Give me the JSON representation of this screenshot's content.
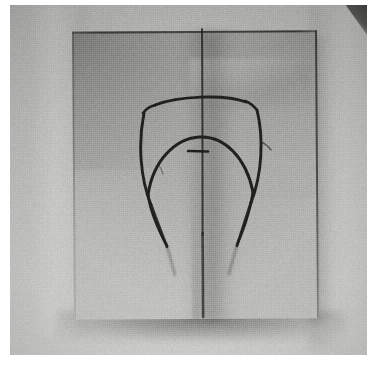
{
  "image": {
    "kind": "photograph",
    "subject": "surgical marking pattern drawn on a square cloth drape",
    "tone": "grayscale / black-and-white",
    "caption": "",
    "width": 374,
    "height": 368,
    "background_color": "#ffffff"
  },
  "photo": {
    "x": 10,
    "y": 5,
    "width": 357,
    "height": 350,
    "backdrop_color": "#c3c3c1",
    "has_corner_artifact": true,
    "corner_artifact_color": "#434341"
  },
  "cloth": {
    "label": "cloth-drape",
    "x": 63,
    "y": 26,
    "width": 245,
    "height": 288,
    "fill_color": "#aaaaa8",
    "edge_color": "#30302e",
    "shadow_color": "#000000",
    "texture": "woven-linen"
  },
  "drawing": {
    "label": "surgical-marking-pattern",
    "ink_color": "#1b1b19",
    "stroke_width": 2.6,
    "elements": [
      {
        "name": "midline-fold-line",
        "type": "vertical-line",
        "x": 202,
        "y1": 30,
        "y2": 320
      },
      {
        "name": "upper-arc",
        "type": "arc",
        "x1": 155,
        "y1": 108,
        "xm": 196,
        "ym": 101,
        "x2": 236,
        "y2": 105
      },
      {
        "name": "left-shoulder-tick",
        "type": "short-line",
        "x1": 152,
        "y1": 106,
        "x2": 145,
        "y2": 113
      },
      {
        "name": "right-shoulder-tick",
        "type": "short-line",
        "x1": 238,
        "y1": 104,
        "x2": 246,
        "y2": 112
      },
      {
        "name": "left-outer-limb",
        "type": "curve",
        "x1": 147,
        "y1": 112,
        "x2": 160,
        "y2": 212
      },
      {
        "name": "right-outer-limb",
        "type": "curve",
        "x1": 245,
        "y1": 111,
        "x2": 238,
        "y2": 212
      },
      {
        "name": "inner-arch",
        "type": "arc",
        "x1": 152,
        "y1": 188,
        "xm": 197,
        "ym": 138,
        "x2": 240,
        "y2": 188
      },
      {
        "name": "nipple-tick-mark",
        "type": "short-horizontal-line",
        "x1": 188,
        "y1": 151,
        "x2": 206,
        "y2": 151
      },
      {
        "name": "left-lower-tail",
        "type": "line",
        "x1": 152,
        "y1": 192,
        "x2": 161,
        "y2": 218
      },
      {
        "name": "right-lower-tail",
        "type": "line",
        "x1": 241,
        "y1": 192,
        "x2": 236,
        "y2": 218
      }
    ]
  }
}
